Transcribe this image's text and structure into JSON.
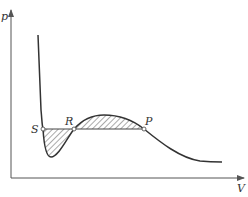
{
  "diagram": {
    "title": "",
    "axes": {
      "y_label": "p",
      "x_label": "V"
    },
    "points": [
      {
        "id": "S",
        "label": "S"
      },
      {
        "id": "R",
        "label": "R"
      },
      {
        "id": "P",
        "label": "P"
      }
    ],
    "colors": {
      "line": "#333333",
      "axis": "#555555",
      "hatch": "#555555",
      "background": "#ffffff"
    }
  }
}
